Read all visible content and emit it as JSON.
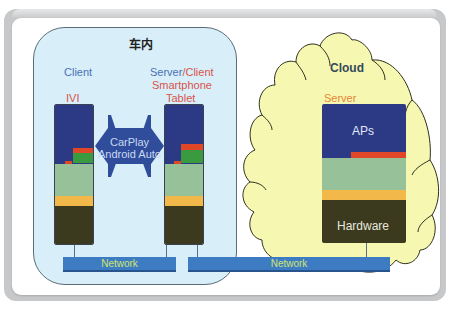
{
  "diagram": {
    "vehicle_title": "车内",
    "client_label": "Client",
    "ivi_label": "IVI",
    "phone_role_server": "Server",
    "phone_role_sep_client": "/Client",
    "phone_device_1": "Smartphone",
    "phone_device_2": "Tablet",
    "connection_label_1": "CarPlay",
    "connection_label_2": "Android Auto",
    "cloud_title": "Cloud",
    "cloud_server_label": "Server",
    "cloud_apps_label": "APs",
    "cloud_hardware_label": "Hardware",
    "network_left_label": "Network",
    "network_right_label": "Network"
  },
  "colors": {
    "vehicle_bg": "#d8effa",
    "cloud_bg": "#f6f7b0",
    "navy": "#2c3a86",
    "light_green": "#97c299",
    "yellow": "#f3b84a",
    "olive": "#3b3a1f",
    "red": "#e04628",
    "green": "#3a9a3f",
    "network": "#3d7cc3",
    "network_text": "#cfe56c",
    "client_text": "#4a6fb5",
    "device_text": "#d9534a",
    "server_text": "#e8853a"
  }
}
